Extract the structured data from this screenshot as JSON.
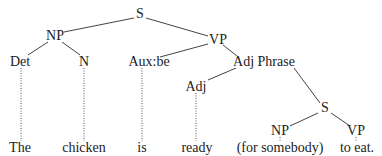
{
  "diagram": {
    "type": "syntax-tree",
    "sentence": "The chicken is ready (for somebody) to eat.",
    "nodes": [
      {
        "id": "S1",
        "label": "S",
        "x": 140,
        "y": 14
      },
      {
        "id": "NP1",
        "label": "NP",
        "x": 55,
        "y": 36
      },
      {
        "id": "VP1",
        "label": "VP",
        "x": 218,
        "y": 40
      },
      {
        "id": "Det",
        "label": "Det",
        "x": 20,
        "y": 62
      },
      {
        "id": "N",
        "label": "N",
        "x": 84,
        "y": 62
      },
      {
        "id": "Aux",
        "label": "Aux:be",
        "x": 149,
        "y": 62
      },
      {
        "id": "AdjP",
        "label": "Adj Phrase",
        "x": 260,
        "y": 62
      },
      {
        "id": "Adj",
        "label": "Adj",
        "x": 196,
        "y": 87
      },
      {
        "id": "S2",
        "label": "S",
        "x": 325,
        "y": 108
      },
      {
        "id": "NP2",
        "label": "NP",
        "x": 280,
        "y": 131
      },
      {
        "id": "VP2",
        "label": "VP",
        "x": 356,
        "y": 131
      }
    ],
    "words": [
      {
        "id": "w1",
        "label": "The",
        "x": 20,
        "y": 148
      },
      {
        "id": "w2",
        "label": "chicken",
        "x": 84,
        "y": 148
      },
      {
        "id": "w3",
        "label": "is",
        "x": 142,
        "y": 148
      },
      {
        "id": "w4",
        "label": "ready",
        "x": 197,
        "y": 148
      },
      {
        "id": "w5",
        "label": "(for somebody)",
        "x": 280,
        "y": 148
      },
      {
        "id": "w6",
        "label": "to eat.",
        "x": 357,
        "y": 148
      }
    ],
    "edges": [
      [
        "S1",
        "NP1"
      ],
      [
        "S1",
        "VP1"
      ],
      [
        "NP1",
        "Det"
      ],
      [
        "NP1",
        "N"
      ],
      [
        "VP1",
        "Aux"
      ],
      [
        "VP1",
        "AdjP"
      ],
      [
        "AdjP",
        "Adj"
      ],
      [
        "AdjP",
        "S2"
      ],
      [
        "S2",
        "NP2"
      ],
      [
        "S2",
        "VP2"
      ]
    ],
    "leaf_links": [
      [
        "Det",
        "w1"
      ],
      [
        "N",
        "w2"
      ],
      [
        "Aux",
        "w3"
      ],
      [
        "Adj",
        "w4"
      ],
      [
        "NP2",
        "w5"
      ],
      [
        "VP2",
        "w6"
      ]
    ]
  }
}
